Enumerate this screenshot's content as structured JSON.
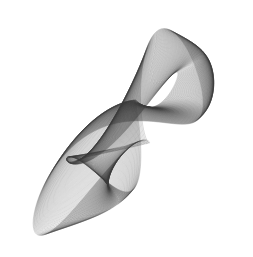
{
  "figure": {
    "background": "#ffffff",
    "stroke_color": "#3a3a3a",
    "stroke_opacity": 0.55,
    "stroke_width": 0.35,
    "width": 253,
    "height": 257,
    "params": {
      "cx": 128,
      "cy": 132,
      "loops": 120,
      "steps_per_loop": 140,
      "ax": 100,
      "ay": 104,
      "fx1": 1.0,
      "fx2": 2.0,
      "fy1": 1.0,
      "fy2": 3.0,
      "px1": 0.3,
      "px2": 1.2,
      "py1": 1.9,
      "py2": 0.6,
      "b2": 0.38,
      "b3": 0.28,
      "drift": 0.012,
      "shrink": 0.35
    }
  }
}
